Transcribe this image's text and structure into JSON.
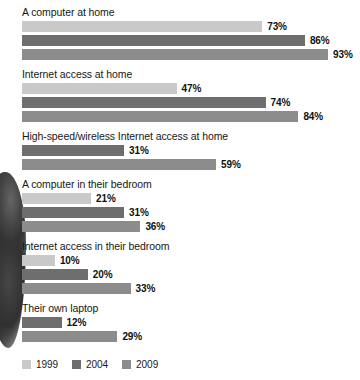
{
  "chart_data": {
    "type": "bar",
    "orientation": "horizontal",
    "title": "",
    "subtitle": "",
    "xlabel": "",
    "ylabel": "",
    "xlim": [
      0,
      100
    ],
    "grid": false,
    "legend_position": "bottom-left",
    "value_suffix": "%",
    "categories": [
      "A computer at home",
      "Internet access at home",
      "High-speed/wireless Internet access at home",
      "A computer in their bedroom",
      "Internet access in their bedroom",
      "Their own laptop"
    ],
    "series": [
      {
        "name": "1999",
        "color": "#c9c9c9",
        "values": [
          73,
          47,
          null,
          21,
          10,
          null
        ]
      },
      {
        "name": "2004",
        "color": "#6e6e6e",
        "values": [
          86,
          74,
          31,
          31,
          20,
          12
        ]
      },
      {
        "name": "2009",
        "color": "#8c8c8c",
        "values": [
          93,
          84,
          59,
          36,
          33,
          29
        ]
      }
    ],
    "groups": [
      {
        "label": "A computer at home",
        "bars": [
          {
            "series": "1999",
            "value": 73,
            "value_label": "73%",
            "color": "#c9c9c9"
          },
          {
            "series": "2004",
            "value": 86,
            "value_label": "86%",
            "color": "#6e6e6e"
          },
          {
            "series": "2009",
            "value": 93,
            "value_label": "93%",
            "color": "#8c8c8c"
          }
        ]
      },
      {
        "label": "Internet access at home",
        "bars": [
          {
            "series": "1999",
            "value": 47,
            "value_label": "47%",
            "color": "#c9c9c9"
          },
          {
            "series": "2004",
            "value": 74,
            "value_label": "74%",
            "color": "#6e6e6e"
          },
          {
            "series": "2009",
            "value": 84,
            "value_label": "84%",
            "color": "#8c8c8c"
          }
        ]
      },
      {
        "label": "High-speed/wireless Internet access at home",
        "bars": [
          {
            "series": "2004",
            "value": 31,
            "value_label": "31%",
            "color": "#6e6e6e"
          },
          {
            "series": "2009",
            "value": 59,
            "value_label": "59%",
            "color": "#8c8c8c"
          }
        ]
      },
      {
        "label": "A computer in their bedroom",
        "bars": [
          {
            "series": "1999",
            "value": 21,
            "value_label": "21%",
            "color": "#c9c9c9"
          },
          {
            "series": "2004",
            "value": 31,
            "value_label": "31%",
            "color": "#6e6e6e"
          },
          {
            "series": "2009",
            "value": 36,
            "value_label": "36%",
            "color": "#8c8c8c"
          }
        ]
      },
      {
        "label": "Internet access in their bedroom",
        "bars": [
          {
            "series": "1999",
            "value": 10,
            "value_label": "10%",
            "color": "#c9c9c9"
          },
          {
            "series": "2004",
            "value": 20,
            "value_label": "20%",
            "color": "#6e6e6e"
          },
          {
            "series": "2009",
            "value": 33,
            "value_label": "33%",
            "color": "#8c8c8c"
          }
        ]
      },
      {
        "label": "Their own laptop",
        "bars": [
          {
            "series": "2004",
            "value": 12,
            "value_label": "12%",
            "color": "#6e6e6e"
          },
          {
            "series": "2009",
            "value": 29,
            "value_label": "29%",
            "color": "#8c8c8c"
          }
        ]
      }
    ]
  },
  "legend": {
    "items": [
      {
        "label": "1999",
        "color": "#c9c9c9",
        "key": "y1999"
      },
      {
        "label": "2004",
        "color": "#6e6e6e",
        "key": "y2004"
      },
      {
        "label": "2009",
        "color": "#8c8c8c",
        "key": "y2009"
      }
    ]
  },
  "layout": {
    "bar_px_per_unit": 3.29,
    "bar_origin_x": 22
  }
}
